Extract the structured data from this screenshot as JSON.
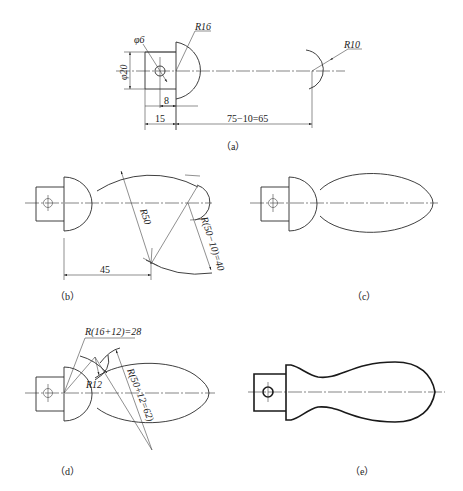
{
  "figure": {
    "panels": [
      {
        "id": "a",
        "caption": "（a）",
        "dimensions": {
          "phi6": "φ6",
          "r16": "R16",
          "phi20": "φ20",
          "d8": "8",
          "d15": "15",
          "d65": "75−10=65",
          "r10": "R10"
        }
      },
      {
        "id": "b",
        "caption": "（b）",
        "dimensions": {
          "r50": "R50",
          "r40": "R(50−10)=40",
          "d45": "45"
        }
      },
      {
        "id": "c",
        "caption": "（c）"
      },
      {
        "id": "d",
        "caption": "（d）",
        "dimensions": {
          "r28": "R(16+12)=28",
          "r12": "R12",
          "r62": "R(50+12=62)"
        }
      },
      {
        "id": "e",
        "caption": "（e）"
      }
    ]
  }
}
